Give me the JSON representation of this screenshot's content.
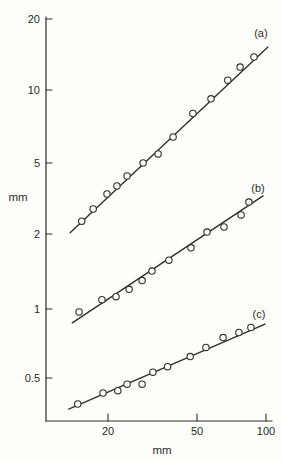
{
  "figure": {
    "background": "#fdfdfb",
    "ink": "#2e2e2e",
    "text_color": "#2b2b2b"
  },
  "chart_data": {
    "type": "scatter",
    "x_scale": "log",
    "y_scale": "log",
    "xlabel": "mm",
    "ylabel": "mm",
    "title": "",
    "grid": false,
    "legend_position": "labels-at-line-ends",
    "x_ticks": [
      20,
      50,
      100
    ],
    "x_tick_labels": [
      "20",
      "50",
      "100"
    ],
    "y_ticks": [
      20,
      10,
      5,
      2,
      1,
      0.5
    ],
    "y_tick_labels": [
      "20",
      "10",
      "5",
      "2",
      "1",
      "0.5"
    ],
    "x_range_mm": [
      10.5,
      110
    ],
    "y_range_mm": [
      0.33,
      21
    ],
    "series": [
      {
        "name": "(a)",
        "marker": "open-circle",
        "points": [
          [
            15.3,
            2.36
          ],
          [
            17.2,
            2.76
          ],
          [
            19.8,
            3.35
          ],
          [
            21.9,
            3.72
          ],
          [
            24.3,
            4.23
          ],
          [
            28.6,
            5.0
          ],
          [
            33.3,
            5.45
          ],
          [
            38.8,
            6.4
          ],
          [
            47.5,
            8.0
          ],
          [
            57.1,
            9.2
          ],
          [
            67.8,
            11.0
          ],
          [
            76.8,
            12.5
          ],
          [
            88.5,
            13.8
          ]
        ],
        "fit_line": [
          [
            13.6,
            2.03
          ],
          [
            102,
            15.2
          ]
        ]
      },
      {
        "name": "(b)",
        "marker": "open-circle",
        "points": [
          [
            14.9,
            0.97
          ],
          [
            18.8,
            1.09
          ],
          [
            21.7,
            1.12
          ],
          [
            24.8,
            1.2
          ],
          [
            28.3,
            1.3
          ],
          [
            31.3,
            1.42
          ],
          [
            37.2,
            1.57
          ],
          [
            46.6,
            1.76
          ],
          [
            54.8,
            2.05
          ],
          [
            65.2,
            2.19
          ],
          [
            77.6,
            2.56
          ],
          [
            84.0,
            3.02
          ]
        ],
        "fit_line": [
          [
            13.9,
            0.87
          ],
          [
            97,
            3.27
          ]
        ]
      },
      {
        "name": "(c)",
        "marker": "open-circle",
        "points": [
          [
            14.7,
            0.385
          ],
          [
            19.0,
            0.43
          ],
          [
            22.1,
            0.44
          ],
          [
            24.3,
            0.47
          ],
          [
            28.3,
            0.47
          ],
          [
            31.6,
            0.53
          ],
          [
            36.7,
            0.56
          ],
          [
            46.2,
            0.62
          ],
          [
            54.2,
            0.68
          ],
          [
            64.6,
            0.75
          ],
          [
            75.9,
            0.79
          ],
          [
            85.7,
            0.83
          ]
        ],
        "fit_line": [
          [
            13.4,
            0.366
          ],
          [
            99,
            0.86
          ]
        ]
      }
    ],
    "axis_layout": {
      "plot": {
        "left": 46,
        "top": 17,
        "right": 272,
        "bottom": 421
      },
      "x_tick_px": [
        108,
        197,
        266
      ],
      "y_tick_px": [
        19,
        90,
        163,
        234,
        309,
        378
      ],
      "y_label_px": [
        18,
        197
      ],
      "x_label_px": [
        162,
        450
      ],
      "series_label_offset": [
        [
          -7,
          -14
        ],
        [
          -5,
          -8
        ],
        [
          -6,
          -10
        ]
      ]
    }
  }
}
